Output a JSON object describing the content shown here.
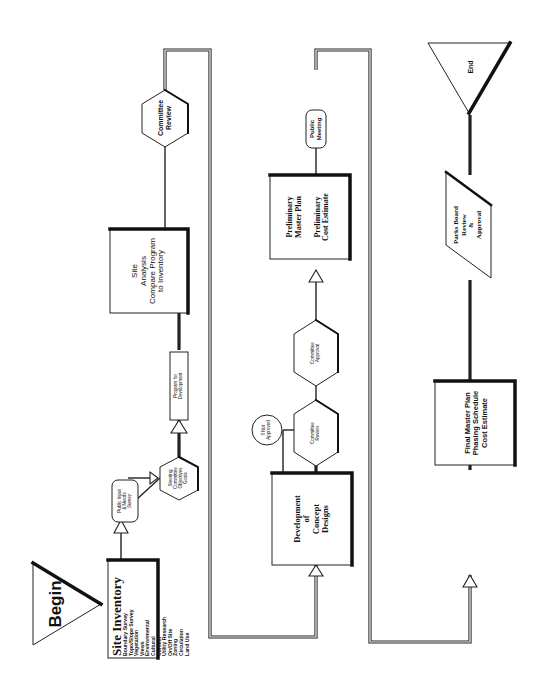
{
  "diagram": {
    "orientation": "rotated 90 degrees counter-clockwise",
    "nodes": {
      "begin": {
        "shape": "triangle",
        "label": "Begin"
      },
      "site_inventory": {
        "shape": "rectangle",
        "title": "Site Inventory",
        "items": [
          "Boundary Survey",
          "Topo/Slope Survey",
          "Vegetation",
          "Views",
          "Environmental",
          "Cultural",
          "Context",
          "Utility Research",
          "On/Off Site",
          "Zoning",
          "Circulation",
          "Land Use"
        ]
      },
      "public_input": {
        "shape": "rounded-rectangle",
        "lines": [
          "Public Input",
          "& Needs",
          "Survey"
        ]
      },
      "steering_committee": {
        "shape": "hexagon",
        "lines": [
          "Steering",
          "Committee",
          "Objectives",
          "Goals"
        ]
      },
      "program": {
        "shape": "rectangle",
        "lines": [
          "Program for",
          "Development"
        ]
      },
      "site_analysis": {
        "shape": "rectangle",
        "lines": [
          "Site",
          "Analysis",
          "Compare Program",
          "to Inventory"
        ]
      },
      "committee_review_1": {
        "shape": "hexagon",
        "lines": [
          "Committee",
          "Review"
        ]
      },
      "concept_designs": {
        "shape": "rectangle",
        "lines": [
          "Development",
          "of",
          "Concept",
          "Designs"
        ]
      },
      "committee_review_2": {
        "shape": "hexagon",
        "lines": [
          "Committee",
          "Review"
        ]
      },
      "if_not_approved": {
        "shape": "circle",
        "lines": [
          "If Not",
          "Approved"
        ]
      },
      "committee_approval": {
        "shape": "hexagon",
        "lines": [
          "Committee",
          "Approval"
        ]
      },
      "preliminary_plan": {
        "shape": "rectangle",
        "lines": [
          "Preliminary",
          "Master Plan",
          "",
          "Preliminary",
          "Cost Estimate"
        ]
      },
      "public_meeting": {
        "shape": "rounded-rectangle",
        "lines": [
          "Public",
          "Meeting"
        ]
      },
      "final_plan": {
        "shape": "rectangle",
        "lines": [
          "Final Master Plan",
          "Phasing Schedule",
          "Cost Estimate"
        ]
      },
      "parks_board": {
        "shape": "parallelogram",
        "lines": [
          "Parks Board",
          "Review",
          "&",
          "Approval"
        ]
      },
      "end": {
        "shape": "triangle",
        "label": "End"
      }
    },
    "flow": [
      "begin",
      "site_inventory",
      "public_input",
      "steering_committee",
      "program",
      "site_analysis",
      "committee_review_1",
      "concept_designs",
      "committee_review_2",
      "committee_approval",
      "preliminary_plan",
      "public_meeting",
      "final_plan",
      "parks_board",
      "end"
    ]
  }
}
